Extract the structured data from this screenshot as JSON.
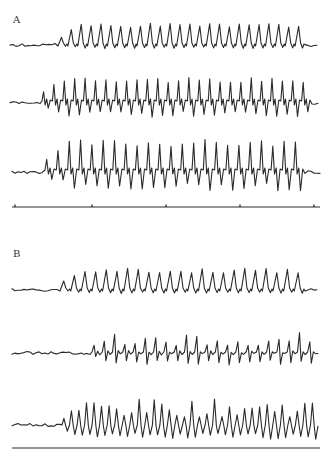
{
  "figure": {
    "panels": [
      {
        "label": "A",
        "label_pos": {
          "x": 13,
          "y": 14
        },
        "traces": [
          {
            "id": "A1",
            "baseline": 45,
            "x_start": 10,
            "x_end": 318,
            "onset": 58,
            "end_burst": 305,
            "peaks": 25,
            "amp_up": 20,
            "amp_down": 3,
            "style": "rounded-peaks",
            "seed": 1
          },
          {
            "id": "A2",
            "baseline": 103,
            "x_start": 10,
            "x_end": 318,
            "onset": 42,
            "end_burst": 312,
            "peaks": 26,
            "amp_up": 24,
            "amp_down": 12,
            "style": "sharp-biphasic",
            "seed": 2
          },
          {
            "id": "A3",
            "baseline": 172,
            "x_start": 12,
            "x_end": 320,
            "onset": 45,
            "end_burst": 305,
            "peaks": 23,
            "amp_up": 30,
            "amp_down": 16,
            "style": "sharp-biphasic",
            "seed": 3
          }
        ],
        "time_line": {
          "y": 207,
          "x_start": 12,
          "x_end": 320,
          "ticks": [
            15,
            92,
            166,
            240,
            314
          ]
        }
      },
      {
        "label": "B",
        "label_pos": {
          "x": 13,
          "y": 248
        },
        "traces": [
          {
            "id": "B1",
            "baseline": 290,
            "x_start": 12,
            "x_end": 318,
            "onset": 60,
            "end_burst": 305,
            "peaks": 23,
            "amp_up": 20,
            "amp_down": 3,
            "style": "rounded-peaks",
            "seed": 4
          },
          {
            "id": "B2",
            "baseline": 353,
            "x_start": 12,
            "x_end": 320,
            "onset": 92,
            "end_burst": 318,
            "peaks": 22,
            "amp_up": 16,
            "amp_down": 10,
            "style": "irregular",
            "seed": 5
          },
          {
            "id": "B3",
            "baseline": 425,
            "x_start": 12,
            "x_end": 320,
            "onset": 62,
            "end_burst": 318,
            "peaks": 34,
            "amp_up": 20,
            "amp_down": 12,
            "style": "dense-irregular",
            "seed": 6
          }
        ],
        "time_line": {
          "y": 448,
          "x_start": 12,
          "x_end": 320,
          "ticks": []
        }
      }
    ]
  },
  "colors": {
    "ink": "#2a2a2a",
    "background": "#ffffff"
  }
}
